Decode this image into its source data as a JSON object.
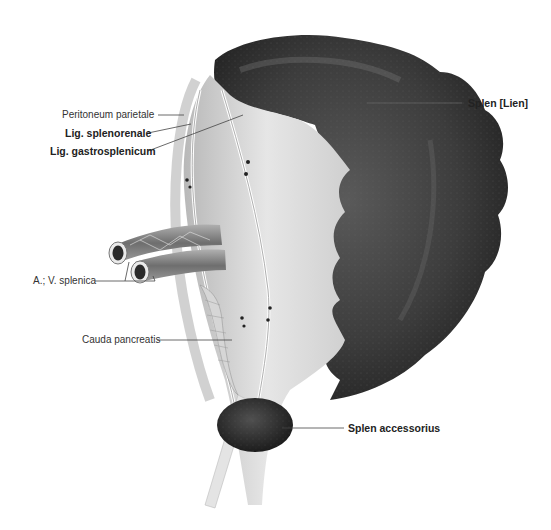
{
  "figure": {
    "colors": {
      "spleen": "#3a3a3a",
      "spleen_highlight": "#6a6a6a",
      "peritoneum": "#dcdcdc",
      "peritoneum_light": "#eeeeee",
      "vessel": "#8a8a8a",
      "leader_line": "#444444",
      "background": "#ffffff"
    },
    "labels": [
      {
        "id": "peritoneum-parietale",
        "text": "Peritoneum parietale",
        "bold": false,
        "x": 62,
        "y": 109
      },
      {
        "id": "lig-splenorenale",
        "text": "Lig. splenorenale",
        "bold": true,
        "x": 65,
        "y": 127
      },
      {
        "id": "lig-gastrosplenicum",
        "text": "Lig. gastrosplenicum",
        "bold": true,
        "x": 50,
        "y": 145
      },
      {
        "id": "a-v-splenica",
        "text": "A.; V. splenica",
        "bold": false,
        "x": 33,
        "y": 275
      },
      {
        "id": "cauda-pancreatis",
        "text": "Cauda pancreatis",
        "bold": false,
        "x": 82,
        "y": 334
      },
      {
        "id": "splen-lien",
        "text": "Splen [Lien]",
        "bold": true,
        "x": 468,
        "y": 99
      },
      {
        "id": "splen-accessorius",
        "text": "Splen accessorius",
        "bold": true,
        "x": 348,
        "y": 423
      }
    ]
  }
}
